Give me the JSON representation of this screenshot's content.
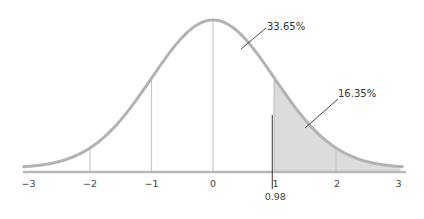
{
  "chart_data": {
    "type": "area",
    "title": "",
    "xlabel": "",
    "ylabel": "",
    "distribution": "standard normal",
    "xlim": [
      -3,
      3
    ],
    "x_ticks": [
      -3,
      -2,
      -1,
      0,
      1,
      2,
      3
    ],
    "x_tick_labels": [
      "−3",
      "−2",
      "−1",
      "0",
      "1",
      "2",
      "3"
    ],
    "vertical_gridlines_at": [
      -2,
      -1,
      0,
      1,
      2
    ],
    "shaded_region": {
      "from": 0.98,
      "to": 3
    },
    "marker": {
      "x": 0.98,
      "label": "0.98"
    },
    "annotations": [
      {
        "label": "33.65%",
        "region": "0 to 0.98"
      },
      {
        "label": "16.35%",
        "region": "0.98 to 3 (upper tail)"
      }
    ],
    "grid": false,
    "legend": null
  },
  "colors": {
    "curve": "#b3b3b3",
    "axis": "#b8b8b8",
    "gridline": "#c8c8c8",
    "shade": "#dcdcdc",
    "marker": "#333333",
    "leader": "#333333"
  },
  "layout": {
    "center_x": 213,
    "px_per_sd": 61.5,
    "base_y": 168,
    "peak_height": 148,
    "axis_y": 172,
    "axis_x_start": 23,
    "axis_x_end": 406,
    "tick_label_y": 187,
    "marker_top_y": 115,
    "marker_bottom_y": 189,
    "marker_label_y": 200
  },
  "annotation_positions": [
    {
      "label_x": 267,
      "label_y": 30,
      "line": [
        266,
        28,
        241,
        49
      ]
    },
    {
      "label_x": 338,
      "label_y": 97,
      "line": [
        338,
        99,
        305,
        128
      ]
    }
  ]
}
